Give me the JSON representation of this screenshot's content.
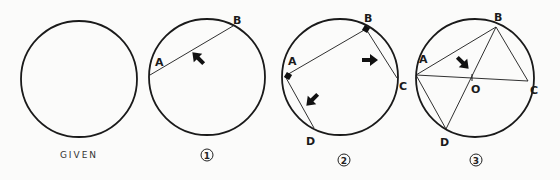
{
  "panels": [
    {
      "caption": "GIVEN"
    },
    {
      "caption": "1",
      "labels": {
        "A": "A",
        "B": "B"
      }
    },
    {
      "caption": "2",
      "labels": {
        "A": "A",
        "B": "B",
        "C": "C",
        "D": "D"
      }
    },
    {
      "caption": "3",
      "labels": {
        "A": "A",
        "B": "B",
        "C": "C",
        "D": "D",
        "O": "O"
      }
    }
  ],
  "colors": {
    "stroke": "#1a1a1a",
    "background": "#fbfbfa"
  }
}
